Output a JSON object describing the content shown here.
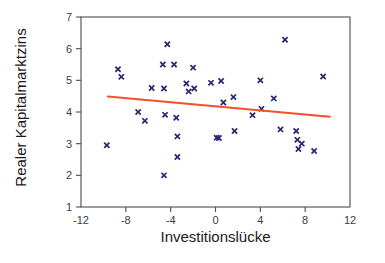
{
  "chart_data": {
    "type": "scatter",
    "title": "",
    "xlabel": "Investitionslücke",
    "ylabel": "Realer Kapitalmarktzins",
    "xlim": [
      -12,
      12
    ],
    "ylim": [
      1,
      7
    ],
    "xticks": [
      -12,
      -8,
      -4,
      0,
      4,
      8,
      12
    ],
    "xtick_labels": [
      "-12",
      "-8",
      "-4",
      "0",
      "4",
      "8",
      "12"
    ],
    "yticks": [
      1,
      2,
      3,
      4,
      5,
      6,
      7
    ],
    "ytick_labels": [
      "1",
      "2",
      "3",
      "4",
      "5",
      "6",
      "7"
    ],
    "grid": false,
    "legend": "none",
    "marker_color": "#262673",
    "marker_symbol": "x",
    "trendline": {
      "name": "Regressionsgerade",
      "color": "#f4502a",
      "x": [
        -9.6,
        10.2
      ],
      "y": [
        4.49,
        3.85
      ]
    },
    "series": [
      {
        "name": "Beobachtungen",
        "points": [
          [
            -9.7,
            2.95
          ],
          [
            -8.7,
            5.35
          ],
          [
            -8.4,
            5.11
          ],
          [
            -6.9,
            4.0
          ],
          [
            -6.3,
            3.72
          ],
          [
            -5.7,
            4.76
          ],
          [
            -4.7,
            5.5
          ],
          [
            -4.6,
            4.74
          ],
          [
            -4.6,
            2.0
          ],
          [
            -4.5,
            3.91
          ],
          [
            -4.3,
            6.14
          ],
          [
            -3.7,
            5.5
          ],
          [
            -3.5,
            3.82
          ],
          [
            -3.4,
            3.23
          ],
          [
            -3.4,
            2.58
          ],
          [
            -2.6,
            4.9
          ],
          [
            -2.4,
            4.65
          ],
          [
            -2.0,
            5.4
          ],
          [
            -1.9,
            4.74
          ],
          [
            -0.4,
            4.92
          ],
          [
            0.1,
            3.19
          ],
          [
            0.3,
            3.18
          ],
          [
            0.5,
            4.98
          ],
          [
            0.7,
            4.3
          ],
          [
            1.6,
            4.47
          ],
          [
            1.7,
            3.4
          ],
          [
            3.3,
            3.9
          ],
          [
            4.0,
            5.0
          ],
          [
            4.1,
            4.1
          ],
          [
            5.2,
            4.43
          ],
          [
            5.8,
            3.45
          ],
          [
            6.2,
            6.28
          ],
          [
            7.2,
            3.4
          ],
          [
            7.3,
            3.12
          ],
          [
            7.4,
            2.83
          ],
          [
            7.7,
            3.0
          ],
          [
            8.8,
            2.77
          ],
          [
            9.6,
            5.12
          ]
        ]
      }
    ]
  }
}
